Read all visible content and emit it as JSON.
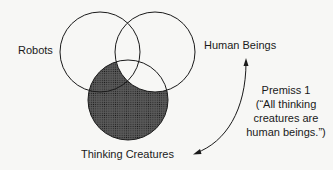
{
  "diagram": {
    "type": "venn",
    "sets": [
      {
        "id": "robots",
        "label": "Robots"
      },
      {
        "id": "human_beings",
        "label": "Human Beings"
      },
      {
        "id": "thinking_creatures",
        "label": "Thinking Creatures"
      }
    ],
    "shaded_region": "thinking_creatures minus human_beings",
    "shade_color": "#3a3a3a",
    "annotation": {
      "line1": "Premiss 1",
      "line2": "(“All thinking",
      "line3": "creatures are",
      "line4": "human beings.”)"
    }
  }
}
